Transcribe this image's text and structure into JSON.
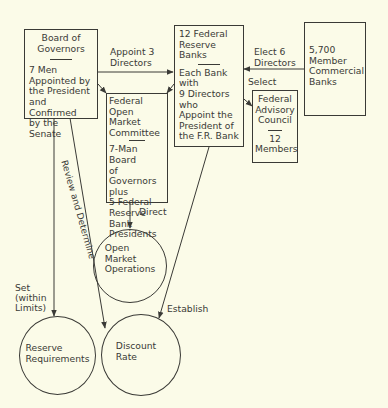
{
  "diagram": {
    "colors": {
      "background": "#fbfbe8",
      "ink": "#3a3a36"
    },
    "nodes": {
      "board_of_governors": {
        "title": [
          "Board of",
          "Governors"
        ],
        "body": [
          "7 Men",
          "Appointed by",
          "the President",
          "and Confirmed",
          "by the Senate"
        ]
      },
      "federal_reserve_banks": {
        "title": [
          "12 Federal",
          "Reserve Banks"
        ],
        "body": [
          "Each Bank",
          "with",
          "9 Directors",
          "who",
          "Appoint the",
          "President of",
          "the F.R. Bank"
        ]
      },
      "member_banks": {
        "body": [
          "5,700",
          "Member",
          "Commercial",
          "Banks"
        ]
      },
      "fomc": {
        "title": [
          "Federal",
          "Open Market",
          "Committee"
        ],
        "body": [
          "7-Man Board",
          "of Governors",
          "plus",
          "5 Federal",
          "Reserve Bank",
          "Presidents"
        ]
      },
      "advisory_council": {
        "title": [
          "Federal",
          "Advisory",
          "Council"
        ],
        "body": [
          "12",
          "Members"
        ]
      },
      "open_market_operations": {
        "body": [
          "Open",
          "Market",
          "Operations"
        ]
      },
      "reserve_requirements": {
        "body": [
          "Reserve",
          "Requirements"
        ]
      },
      "discount_rate": {
        "body": [
          "Discount",
          "Rate"
        ]
      }
    },
    "edges": {
      "appoint_directors": [
        "Appoint 3",
        "Directors"
      ],
      "elect_directors": [
        "Elect 6",
        "Directors"
      ],
      "select": "Select",
      "direct": "Direct",
      "review_determine": "Review and Determine",
      "set_within_limits": [
        "Set",
        "(within",
        "Limits)"
      ],
      "establish": "Establish"
    }
  }
}
